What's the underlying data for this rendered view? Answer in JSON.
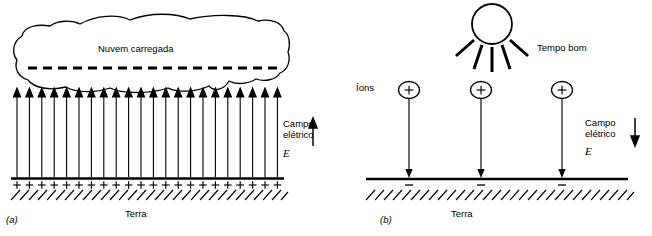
{
  "figure": {
    "panels": [
      {
        "id": "a",
        "letter": "(a)",
        "cloud_label": "Nuvem carregada",
        "field_label": "Campo\nelétrico",
        "field_symbol": "E⃗",
        "ground_label": "Terra",
        "field_direction": "up",
        "arrow_count": 22,
        "charge_sign": "+",
        "charge_count": 22
      },
      {
        "id": "b",
        "letter": "(b)",
        "ions_label": "Íons",
        "weather_label": "Tempo bom",
        "field_label": "Campo\nelétrico",
        "field_symbol": "E⃗",
        "ground_label": "Terra",
        "field_direction": "down",
        "ion_count": 3,
        "ion_sign": "+",
        "ground_sign": "−",
        "sun_rays": 5
      }
    ],
    "colors": {
      "stroke": "#000000",
      "background": "#ffffff"
    }
  }
}
